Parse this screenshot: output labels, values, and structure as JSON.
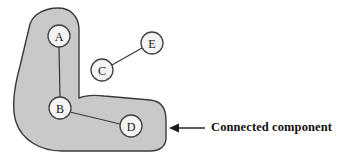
{
  "figure": {
    "background_color": "#ffffff"
  },
  "region": {
    "name": "connected-component-region",
    "fill_color": "#c9c9c9",
    "stroke_color": "#3a3a3a",
    "path": "M 30 24 C 34 13, 46 8, 58 8 C 70 8, 79 16, 79 30 L 79 98 C 86 95, 95 95, 104 96 L 150 100 C 161 101, 166 108, 166 120 L 166 138 C 166 147, 159 151, 150 151 L 62 151 C 40 151, 22 140, 16 122 C 11 107, 14 88, 20 66 Z"
  },
  "nodes": [
    {
      "id": "A",
      "label": "A",
      "cx": 59,
      "cy": 36,
      "r": 11
    },
    {
      "id": "B",
      "label": "B",
      "cx": 60,
      "cy": 108,
      "r": 11
    },
    {
      "id": "C",
      "label": "C",
      "cx": 102,
      "cy": 70,
      "r": 11
    },
    {
      "id": "D",
      "label": "D",
      "cx": 131,
      "cy": 126,
      "r": 11
    },
    {
      "id": "E",
      "label": "E",
      "cx": 152,
      "cy": 43,
      "r": 11
    }
  ],
  "edges": [
    {
      "id": "A-B",
      "from": "A",
      "to": "B",
      "x1": 59,
      "y1": 47,
      "x2": 60,
      "y2": 97
    },
    {
      "id": "B-D",
      "from": "B",
      "to": "D",
      "x1": 70,
      "y1": 112,
      "x2": 120,
      "y2": 124
    },
    {
      "id": "C-E",
      "from": "C",
      "to": "E",
      "x1": 112,
      "y1": 65,
      "x2": 142,
      "y2": 48
    }
  ],
  "annotation": {
    "label": "Connected component",
    "arrow": {
      "name": "pointer-arrow",
      "direction": "left",
      "x_tip": 169,
      "x_tail": 205,
      "y": 128,
      "color": "#1a1a1a"
    }
  }
}
